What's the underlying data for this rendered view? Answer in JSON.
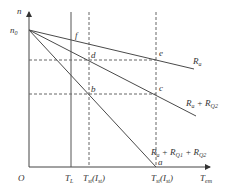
{
  "diagram": {
    "type": "motor-speed-torque-characteristic",
    "axes": {
      "y_label": "n",
      "x_label": "T",
      "x_label_sub": "em",
      "origin_label": "O",
      "n0_label": "n",
      "n0_sub": "0"
    },
    "x_ticks": {
      "tl": {
        "main": "T",
        "sub": "L"
      },
      "tst1": {
        "main": "T",
        "sub": "st",
        "paren_main": "I",
        "paren_sub": "st"
      },
      "tst": {
        "main": "T",
        "sub": "st",
        "paren_main": "I",
        "paren_sub": "st"
      }
    },
    "lines": [
      {
        "name": "R_a",
        "label": "R",
        "label_sub": "a",
        "suffix": ""
      },
      {
        "name": "R_a+R_Q2",
        "label": "R",
        "label_sub": "a",
        "suffix": " + R",
        "suffix_sub": "Q2"
      },
      {
        "name": "R_a+R_Q1+R_Q2",
        "label": "R",
        "label_sub": "a",
        "suffix": " + R",
        "suffix_sub": "Q1",
        "suffix2": " + R",
        "suffix2_sub": "Q2"
      }
    ],
    "points": {
      "a": "a",
      "b": "b",
      "c": "c",
      "d": "d",
      "e": "e",
      "f": "f"
    },
    "colors": {
      "line": "#4a4a4a",
      "dashed": "#555555",
      "text": "#333333"
    }
  }
}
